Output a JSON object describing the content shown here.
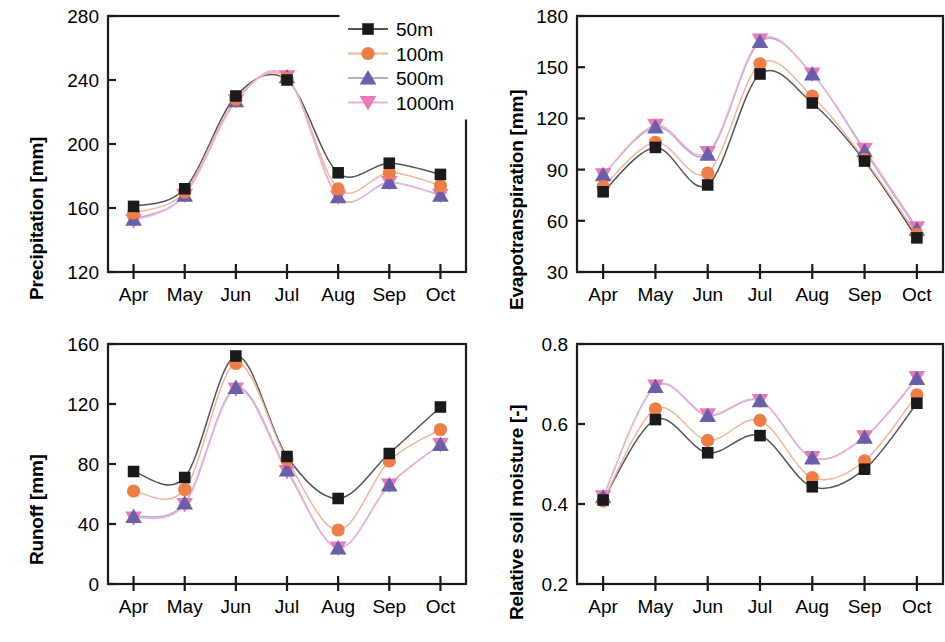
{
  "figure": {
    "width": 945,
    "height": 642,
    "background": "#ffffff"
  },
  "legend": {
    "position": "top-right-of-panel-1",
    "entries": [
      {
        "label": "50m",
        "color": "#1a1a1a",
        "marker": "square",
        "line_color": "#555555"
      },
      {
        "label": "100m",
        "color": "#ef7d46",
        "marker": "circle",
        "line_color": "#f0b59a"
      },
      {
        "label": "500m",
        "color": "#6c5fa9",
        "marker": "triangle-up",
        "line_color": "#b3a9d6"
      },
      {
        "label": "1000m",
        "color": "#e87ab8",
        "marker": "triangle-down",
        "line_color": "#f0b3d4"
      }
    ]
  },
  "months": [
    "Apr",
    "May",
    "Jun",
    "Jul",
    "Aug",
    "Sep",
    "Oct"
  ],
  "chart_data": [
    {
      "id": "precipitation",
      "type": "line",
      "title": "",
      "xlabel": "",
      "ylabel": "Precipitation [mm]",
      "categories": [
        "Apr",
        "May",
        "Jun",
        "Jul",
        "Aug",
        "Sep",
        "Oct"
      ],
      "ylim": [
        120,
        280
      ],
      "yticks": [
        120,
        160,
        200,
        240,
        280
      ],
      "ytick_labels": [
        "120",
        "160",
        "200",
        "240",
        "280"
      ],
      "grid": false,
      "legend_position": "upper right",
      "series": [
        {
          "name": "50m",
          "values": [
            161,
            172,
            230,
            240,
            182,
            188,
            181
          ]
        },
        {
          "name": "100m",
          "values": [
            157,
            170,
            228,
            241,
            172,
            182,
            174
          ]
        },
        {
          "name": "500m",
          "values": [
            153,
            168,
            227,
            242,
            167,
            176,
            168
          ]
        },
        {
          "name": "1000m",
          "values": [
            152,
            168,
            227,
            242,
            167,
            176,
            168
          ]
        }
      ]
    },
    {
      "id": "evapotranspiration",
      "type": "line",
      "title": "",
      "xlabel": "",
      "ylabel": "Evapotranspiration [mm]",
      "categories": [
        "Apr",
        "May",
        "Jun",
        "Jul",
        "Aug",
        "Sep",
        "Oct"
      ],
      "ylim": [
        30,
        180
      ],
      "yticks": [
        30,
        60,
        90,
        120,
        150,
        180
      ],
      "ytick_labels": [
        "30",
        "60",
        "90",
        "120",
        "150",
        "180"
      ],
      "grid": false,
      "legend_position": "none",
      "series": [
        {
          "name": "50m",
          "values": [
            77,
            103,
            81,
            146,
            129,
            95,
            50
          ]
        },
        {
          "name": "100m",
          "values": [
            80,
            106,
            88,
            152,
            133,
            96,
            52
          ]
        },
        {
          "name": "500m",
          "values": [
            87,
            115,
            99,
            165,
            146,
            101,
            55
          ]
        },
        {
          "name": "1000m",
          "values": [
            87,
            116,
            100,
            166,
            146,
            102,
            56
          ]
        }
      ]
    },
    {
      "id": "runoff",
      "type": "line",
      "title": "",
      "xlabel": "",
      "ylabel": "Runoff [mm]",
      "categories": [
        "Apr",
        "May",
        "Jun",
        "Jul",
        "Aug",
        "Sep",
        "Oct"
      ],
      "ylim": [
        0,
        160
      ],
      "yticks": [
        0,
        40,
        80,
        120,
        160
      ],
      "ytick_labels": [
        "0",
        "40",
        "80",
        "120",
        "160"
      ],
      "grid": false,
      "legend_position": "none",
      "series": [
        {
          "name": "50m",
          "values": [
            75,
            71,
            152,
            85,
            57,
            87,
            118
          ]
        },
        {
          "name": "100m",
          "values": [
            62,
            63,
            147,
            83,
            36,
            82,
            103
          ]
        },
        {
          "name": "500m",
          "values": [
            45,
            54,
            131,
            76,
            24,
            66,
            93
          ]
        },
        {
          "name": "1000m",
          "values": [
            44,
            53,
            130,
            75,
            24,
            66,
            93
          ]
        }
      ]
    },
    {
      "id": "relative-soil-moisture",
      "type": "line",
      "title": "",
      "xlabel": "",
      "ylabel": "Relative soil moisture [-]",
      "categories": [
        "Apr",
        "May",
        "Jun",
        "Jul",
        "Aug",
        "Sep",
        "Oct"
      ],
      "ylim": [
        0.2,
        0.8
      ],
      "yticks": [
        0.2,
        0.4,
        0.6,
        0.8
      ],
      "ytick_labels": [
        "0.2",
        "0.4",
        "0.6",
        "0.8"
      ],
      "grid": false,
      "legend_position": "none",
      "series": [
        {
          "name": "50m",
          "values": [
            0.41,
            0.611,
            0.528,
            0.571,
            0.443,
            0.487,
            0.652
          ]
        },
        {
          "name": "100m",
          "values": [
            0.408,
            0.638,
            0.559,
            0.609,
            0.466,
            0.508,
            0.673
          ]
        },
        {
          "name": "500m",
          "values": [
            0.418,
            0.694,
            0.621,
            0.658,
            0.515,
            0.567,
            0.714
          ]
        },
        {
          "name": "1000m",
          "values": [
            0.418,
            0.695,
            0.623,
            0.659,
            0.516,
            0.568,
            0.716
          ]
        }
      ]
    }
  ]
}
